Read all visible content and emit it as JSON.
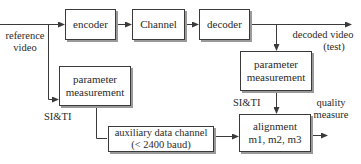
{
  "diagram": {
    "type": "block-diagram",
    "title": "",
    "blocks": {
      "encoder": {
        "label": "encoder"
      },
      "channel": {
        "label": "Channel"
      },
      "decoder": {
        "label": "decoder"
      },
      "param_left": {
        "line1": "parameter",
        "line2": "measurement"
      },
      "aux_channel": {
        "line1": "auxiliary data channel",
        "line2": "(< 2400 baud)"
      },
      "param_right": {
        "line1": "parameter",
        "line2": "measurement"
      },
      "alignment": {
        "line1": "alignment",
        "line2": "m1, m2, m3"
      }
    },
    "labels": {
      "reference_video": {
        "line1": "reference",
        "line2": "video"
      },
      "decoded_video": {
        "line1": "decoded video",
        "line2": "(test)"
      },
      "si_ti_left": "SI&TI",
      "si_ti_right": "SI&TI",
      "quality_measure": {
        "line1": "quality",
        "line2": "measure"
      }
    },
    "edges": [
      {
        "from": "reference video",
        "to": "encoder"
      },
      {
        "from": "encoder",
        "to": "Channel"
      },
      {
        "from": "Channel",
        "to": "decoder"
      },
      {
        "from": "decoder",
        "to": "decoded video (test)"
      },
      {
        "from": "reference video",
        "to": "parameter measurement (left)"
      },
      {
        "from": "parameter measurement (left)",
        "to": "auxiliary data channel",
        "label": "SI&TI"
      },
      {
        "from": "decoder output",
        "to": "parameter measurement (right)"
      },
      {
        "from": "parameter measurement (right)",
        "to": "alignment",
        "label": "SI&TI"
      },
      {
        "from": "auxiliary data channel",
        "to": "alignment"
      },
      {
        "from": "alignment",
        "to": "quality measure"
      }
    ]
  },
  "colors": {
    "line": "#3a3a3a",
    "shadow": "#9a9a9a",
    "background": "#ffffff"
  }
}
